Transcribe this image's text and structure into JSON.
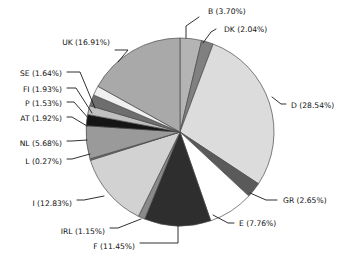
{
  "chart_data": {
    "type": "pie",
    "title": "",
    "subtitle": "",
    "xlabel": "",
    "ylabel": "",
    "legend_position": "none",
    "grid": false,
    "labels_show_percent": true,
    "start_angle_deg": -90,
    "direction": "clockwise",
    "categories": [
      "B",
      "DK",
      "D",
      "GR",
      "E",
      "F",
      "IRL",
      "I",
      "L",
      "NL",
      "AT",
      "P",
      "FI",
      "SE",
      "UK"
    ],
    "values": [
      3.7,
      2.04,
      28.54,
      2.65,
      7.76,
      11.45,
      1.15,
      12.83,
      0.27,
      5.68,
      1.92,
      1.53,
      1.93,
      1.64,
      16.91
    ],
    "unit": "%",
    "slices": [
      {
        "name": "B",
        "value": 3.7,
        "label": "B (3.70%)",
        "color": "#b4b4b4",
        "label_x": 208,
        "label_y": 14,
        "label_align": "right",
        "leader": [
          [
            186,
            38
          ],
          [
            186,
            26
          ],
          [
            199,
            17
          ]
        ]
      },
      {
        "name": "DK",
        "value": 2.04,
        "label": "DK (2.04%)",
        "color": "#808080",
        "label_x": 224,
        "label_y": 32,
        "label_align": "right",
        "leader": [
          [
            203,
            43
          ],
          [
            211,
            32
          ],
          [
            216,
            29
          ]
        ]
      },
      {
        "name": "D",
        "value": 28.54,
        "label": "D (28.54%)",
        "color": "#dcdcdc",
        "label_x": 291,
        "label_y": 108,
        "label_align": "right",
        "leader": [
          [
            272,
            97
          ],
          [
            281,
            104
          ],
          [
            286,
            104
          ]
        ]
      },
      {
        "name": "GR",
        "value": 2.65,
        "label": "GR (2.65%)",
        "color": "#5a5a5a",
        "label_x": 283,
        "label_y": 203,
        "label_align": "right",
        "leader": [
          [
            250,
            193
          ],
          [
            266,
            200
          ],
          [
            277,
            200
          ]
        ]
      },
      {
        "name": "E",
        "value": 7.76,
        "label": "E (7.76%)",
        "color": "#ffffff",
        "label_x": 239,
        "label_y": 226,
        "label_align": "right",
        "leader": [
          [
            213,
            215
          ],
          [
            228,
            223
          ],
          [
            234,
            223
          ]
        ]
      },
      {
        "name": "F",
        "value": 11.45,
        "label": "F (11.45%)",
        "color": "#2e2e2e",
        "label_x": 135,
        "label_y": 249,
        "label_align": "end",
        "leader": [
          [
            178,
            226
          ],
          [
            178,
            243
          ],
          [
            140,
            243
          ]
        ]
      },
      {
        "name": "IRL",
        "value": 1.15,
        "label": "IRL (1.15%)",
        "color": "#8a8a8a",
        "label_x": 105,
        "label_y": 234,
        "label_align": "end",
        "leader": [
          [
            141,
            219
          ],
          [
            118,
            228
          ],
          [
            110,
            228
          ]
        ]
      },
      {
        "name": "I",
        "value": 12.83,
        "label": "I (12.83%)",
        "color": "#d2d2d2",
        "label_x": 72,
        "label_y": 206,
        "label_align": "end",
        "leader": [
          [
            104,
            196
          ],
          [
            84,
            200
          ],
          [
            77,
            200
          ]
        ]
      },
      {
        "name": "L",
        "value": 0.27,
        "label": "L (0.27%)",
        "color": "#777777",
        "label_x": 62,
        "label_y": 164,
        "label_align": "end",
        "leader": [
          [
            90,
            154
          ],
          [
            72,
            159
          ],
          [
            67,
            159
          ]
        ]
      },
      {
        "name": "NL",
        "value": 5.68,
        "label": "NL (5.68%)",
        "color": "#9a9a9a",
        "label_x": 62,
        "label_y": 146,
        "label_align": "end",
        "leader": [
          [
            87,
            140
          ],
          [
            72,
            141
          ],
          [
            67,
            141
          ]
        ]
      },
      {
        "name": "AT",
        "value": 1.92,
        "label": "AT (1.92%)",
        "color": "#151515",
        "label_x": 62,
        "label_y": 121,
        "label_align": "end",
        "leader": [
          [
            87,
            126
          ],
          [
            72,
            117
          ],
          [
            67,
            117
          ]
        ]
      },
      {
        "name": "P",
        "value": 1.53,
        "label": "P (1.53%)",
        "color": "#c0c0c0",
        "label_x": 62,
        "label_y": 106,
        "label_align": "end",
        "leader": [
          [
            89,
            119
          ],
          [
            74,
            102
          ],
          [
            67,
            102
          ]
        ]
      },
      {
        "name": "FI",
        "value": 1.93,
        "label": "FI (1.93%)",
        "color": "#6e6e6e",
        "label_x": 62,
        "label_y": 92,
        "label_align": "end",
        "leader": [
          [
            92,
            113
          ],
          [
            76,
            88
          ],
          [
            67,
            88
          ]
        ]
      },
      {
        "name": "SE",
        "value": 1.64,
        "label": "SE (1.64%)",
        "color": "#f0f0f0",
        "label_x": 62,
        "label_y": 76,
        "label_align": "end",
        "leader": [
          [
            95,
            108
          ],
          [
            80,
            72
          ],
          [
            67,
            72
          ]
        ]
      },
      {
        "name": "UK",
        "value": 16.91,
        "label": "UK (16.91%)",
        "color": "#a9a9a9",
        "label_x": 110,
        "label_y": 45,
        "label_align": "end",
        "leader": [
          [
            118,
            62
          ],
          [
            128,
            50
          ],
          [
            115,
            50
          ]
        ]
      }
    ],
    "geometry": {
      "cx": 180,
      "cy": 132,
      "r": 94
    }
  }
}
